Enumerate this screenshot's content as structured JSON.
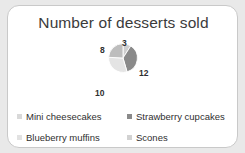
{
  "card": {
    "background_color": "#ffffff",
    "border_color": "#c9c9c9",
    "page_background_color": "#e9e9e9"
  },
  "chart": {
    "title": "Number of desserts sold"
  },
  "chart_data": {
    "type": "pie",
    "title": "Number of desserts sold",
    "xlabel": "",
    "ylabel": "",
    "total": 33,
    "categories": [
      "Strawberry cupcakes",
      "Blueberry muffins",
      "Scones",
      "Mini cheesecakes"
    ],
    "values": [
      3,
      12,
      10,
      8
    ],
    "colors": [
      "#cfcfcf",
      "#8a8a8a",
      "#e4e4e4",
      "#bdbdbd"
    ],
    "data_labels": [
      "3",
      "12",
      "10",
      "8"
    ],
    "legend": {
      "position": "bottom",
      "columns": 2,
      "entries": [
        {
          "label": "Mini cheesecakes",
          "color": "#d9d9d9",
          "value": 8
        },
        {
          "label": "Strawberry cupcakes",
          "color": "#8a8a8a",
          "value": 3
        },
        {
          "label": "Blueberry muffins",
          "color": "#e2e2e2",
          "value": 12
        },
        {
          "label": "Scones",
          "color": "#d2d2d2",
          "value": 10
        }
      ]
    },
    "grid": false,
    "start_angle_deg": 0,
    "slice_border_color": "#ffffff"
  }
}
